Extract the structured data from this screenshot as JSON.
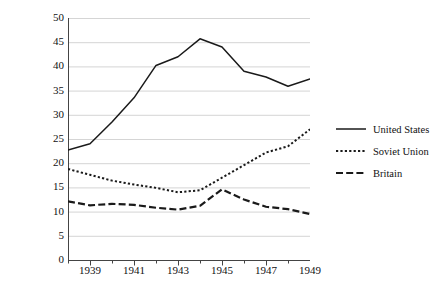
{
  "chart_data": {
    "type": "line",
    "title": "",
    "xlabel": "",
    "ylabel": "% of European capabilities",
    "x": [
      1938,
      1939,
      1940,
      1941,
      1942,
      1943,
      1944,
      1945,
      1946,
      1947,
      1948,
      1949
    ],
    "xlim": [
      1938,
      1949
    ],
    "ylim": [
      0,
      50
    ],
    "ytick_values": [
      0,
      5,
      10,
      15,
      20,
      25,
      30,
      35,
      40,
      45,
      50
    ],
    "xtick_labels": [
      "1939",
      "1941",
      "1943",
      "1945",
      "1947",
      "1949"
    ],
    "xtick_values": [
      1939,
      1941,
      1943,
      1945,
      1947,
      1949
    ],
    "grid": "horizontal",
    "legend_position": "right",
    "series": [
      {
        "name": "United States",
        "style": "solid",
        "color": "#1a1a1a",
        "values": [
          22.7,
          24.0,
          28.5,
          33.5,
          40.2,
          42.0,
          45.7,
          44.0,
          39.0,
          37.8,
          35.9,
          37.4
        ]
      },
      {
        "name": "Soviet Union",
        "style": "dotted",
        "color": "#1a1a1a",
        "values": [
          18.8,
          17.6,
          16.4,
          15.6,
          14.9,
          14.0,
          14.4,
          17.0,
          19.6,
          22.2,
          23.5,
          27.0
        ]
      },
      {
        "name": "Britain",
        "style": "dashed",
        "color": "#1a1a1a",
        "values": [
          12.1,
          11.3,
          11.6,
          11.4,
          10.8,
          10.4,
          11.2,
          14.6,
          12.5,
          11.0,
          10.5,
          9.5
        ]
      }
    ]
  },
  "axis": {
    "y_title": "% of European capabilities"
  },
  "legend": {
    "items": [
      {
        "label": "United States",
        "key": "solid-line-key"
      },
      {
        "label": "Soviet Union",
        "key": "dotted-line-key"
      },
      {
        "label": "Britain",
        "key": "dashed-line-key"
      }
    ]
  }
}
